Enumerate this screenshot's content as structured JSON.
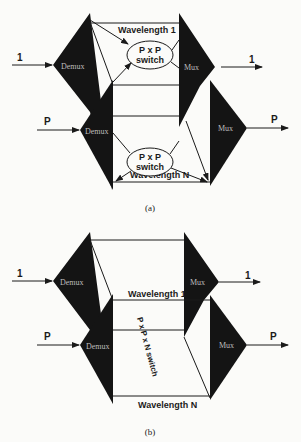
{
  "figure_a": {
    "caption": "(a)",
    "inputs": [
      {
        "label": "1"
      },
      {
        "label": "P"
      }
    ],
    "outputs": [
      {
        "label": "1"
      },
      {
        "label": "P"
      }
    ],
    "demux_label": "Demux",
    "mux_label": "Mux",
    "wavelength_top": "Wavelength 1",
    "wavelength_bottom": "Wavelength N",
    "switch_top": {
      "line1": "P x P",
      "line2": "switch"
    },
    "switch_bottom": {
      "line1": "P x P",
      "line2": "switch"
    }
  },
  "figure_b": {
    "caption": "(b)",
    "inputs": [
      {
        "label": "1"
      },
      {
        "label": "P"
      }
    ],
    "outputs": [
      {
        "label": "1"
      },
      {
        "label": "P"
      }
    ],
    "demux_label": "Demux",
    "mux_label": "Mux",
    "wavelength_top": "Wavelength 1",
    "wavelength_bottom": "Wavelength N",
    "switch_label": "P x P x N switch"
  },
  "colors": {
    "block": "#141414",
    "line": "#1a1a1a",
    "background": "#fbfbf9"
  }
}
